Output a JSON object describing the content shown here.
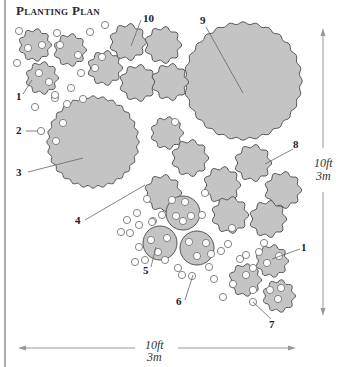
{
  "title": "Planting Plan",
  "labels": {
    "l1a": "1",
    "l1b": "1",
    "l2": "2",
    "l3": "3",
    "l4": "4",
    "l5": "5",
    "l6": "6",
    "l7": "7",
    "l8": "8",
    "l9": "9",
    "l10": "10"
  },
  "scale": {
    "vertical": {
      "ft": "10ft",
      "m": "3m"
    },
    "horizontal": {
      "ft": "10ft",
      "m": "3m"
    }
  },
  "colors": {
    "plant_fill": "#c4c4c4",
    "plant_stroke": "#555555",
    "small_circle_stroke": "#777777",
    "arrow": "#999999"
  }
}
